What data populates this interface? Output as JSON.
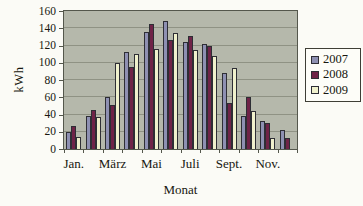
{
  "chart_data": {
    "type": "bar",
    "title": "",
    "xlabel": "Monat",
    "ylabel": "kWh",
    "ylim": [
      0,
      160
    ],
    "ytick_step": 20,
    "grid": true,
    "legend_position": "right",
    "plot_bg_color": "#b5b8ab",
    "categories": [
      "Jan.",
      "Feb.",
      "März",
      "Apr.",
      "Mai",
      "Juni",
      "Juli",
      "Aug.",
      "Sept.",
      "Okt.",
      "Nov.",
      "Dez."
    ],
    "x_ticks_shown": [
      "Jan.",
      "März",
      "Mai",
      "Juli",
      "Sept.",
      "Nov."
    ],
    "series": [
      {
        "name": "2007",
        "color": "#8e90b2",
        "values": [
          20,
          38,
          60,
          113,
          136,
          148,
          124,
          122,
          88,
          38,
          33,
          22
        ]
      },
      {
        "name": "2008",
        "color": "#6f2347",
        "values": [
          27,
          45,
          51,
          95,
          145,
          126,
          131,
          119,
          53,
          60,
          30,
          13
        ]
      },
      {
        "name": "2009",
        "color": "#f0f1cd",
        "values": [
          14,
          37,
          100,
          110,
          116,
          134,
          115,
          108,
          94,
          44,
          13,
          0
        ]
      }
    ]
  }
}
